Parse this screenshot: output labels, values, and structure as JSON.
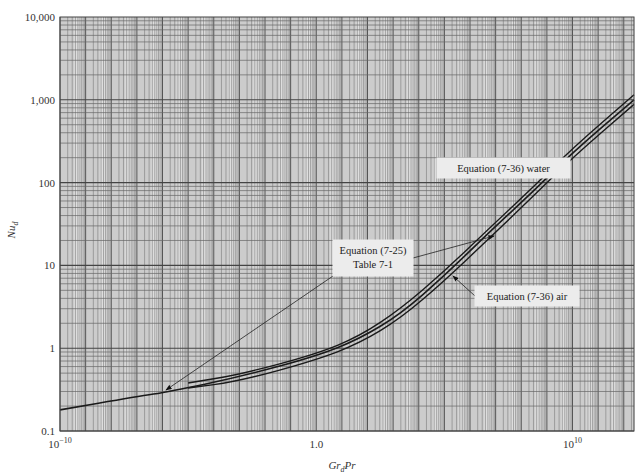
{
  "chart_data": {
    "type": "line",
    "title": "",
    "xlabel": "Gr_d Pr",
    "ylabel": "Nu_d",
    "xscale": "log",
    "yscale": "log",
    "xlim_log10": [
      -10,
      12.4
    ],
    "ylim": [
      0.1,
      10000
    ],
    "grid": true,
    "x_tick_labels": [
      {
        "log10": -10,
        "base": "10",
        "exp": "−10"
      },
      {
        "log10": 0,
        "base": "1.0",
        "exp": ""
      },
      {
        "log10": 10,
        "base": "10",
        "exp": "10"
      }
    ],
    "y_tick_labels": [
      {
        "value": 0.1,
        "label": "0.1"
      },
      {
        "value": 1,
        "label": "1"
      },
      {
        "value": 10,
        "label": "10"
      },
      {
        "value": 100,
        "label": "100"
      },
      {
        "value": 1000,
        "label": "1,000"
      },
      {
        "value": 10000,
        "label": "10,000"
      }
    ],
    "series": [
      {
        "name": "Equation (7-25) Table 7-1",
        "x_log10": [
          -10,
          -7,
          -5.7,
          -3,
          0,
          1.7,
          3.3,
          5,
          6.8,
          8.5,
          10,
          12.4
        ],
        "y": [
          0.18,
          0.26,
          0.3,
          0.45,
          0.8,
          1.3,
          2.6,
          7.5,
          26,
          80,
          230,
          1000
        ]
      },
      {
        "name": "Equation (7-36) water",
        "x_log10": [
          -5,
          -3,
          0,
          1.7,
          3.3,
          5,
          6.8,
          8.5,
          10,
          12.4
        ],
        "y": [
          0.38,
          0.48,
          0.85,
          1.4,
          3.0,
          8.5,
          29,
          90,
          260,
          1150
        ]
      },
      {
        "name": "Equation (7-36) air",
        "x_log10": [
          -5,
          -3,
          0,
          1.7,
          3.3,
          5,
          6.8,
          8.5,
          10,
          12.4
        ],
        "y": [
          0.33,
          0.4,
          0.72,
          1.15,
          2.3,
          6.5,
          22,
          70,
          200,
          880
        ]
      }
    ],
    "annotations": [
      {
        "lines": [
          "Equation (7-36) water"
        ],
        "box_px": [
          437,
          158,
          133,
          20
        ],
        "arrow_to_px": [
          540,
          163
        ]
      },
      {
        "lines": [
          "Equation (7-25)",
          "Table 7-1"
        ],
        "box_px": [
          333,
          240,
          80,
          36
        ],
        "arrow_to_px": [
          [
            166,
            390
          ],
          [
            494,
            236
          ]
        ]
      },
      {
        "lines": [
          "Equation (7-36) air"
        ],
        "box_px": [
          475,
          286,
          104,
          20
        ],
        "arrow_to_px": [
          453,
          276
        ]
      }
    ],
    "legend": "none (callout labels)"
  }
}
